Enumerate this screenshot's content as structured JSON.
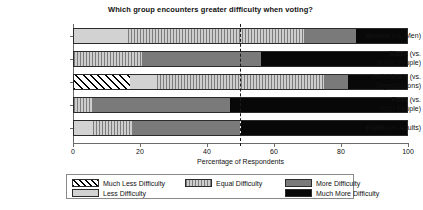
{
  "chart_data": {
    "type": "bar",
    "orientation": "horizontal",
    "stacked": true,
    "normalized": true,
    "title": "Which group encounters greater difficulty when voting?",
    "xlabel": "Percentage of Respondents",
    "ylabel": "",
    "xlim": [
      0,
      100
    ],
    "xticks": [
      0,
      20,
      40,
      60,
      80,
      100
    ],
    "xticklabels": [
      "0",
      "20",
      "40",
      "60",
      "80",
      "100"
    ],
    "grid": false,
    "legend_position": "bottom",
    "reference_line": {
      "value": 50,
      "style": "dashed",
      "color": "#1a1a1a"
    },
    "categories": [
      "Women (vs. Men)",
      "Black (vs. White People)",
      "Individuals (vs. Organizations)",
      "Poor (vs. Rich People)",
      "Youth (vs. Adults)"
    ],
    "category_parts": [
      {
        "group": "Women",
        "comparison": "(vs. Men)",
        "lines": [
          "Women|(vs. Men)"
        ]
      },
      {
        "group": "Black",
        "comparison": "(vs. White People)",
        "lines": [
          "Black|(vs.",
          "White People)"
        ]
      },
      {
        "group": "Individuals",
        "comparison": "(vs. Organizations)",
        "lines": [
          "Individuals|(vs.",
          "Organizations)"
        ]
      },
      {
        "group": "Poor",
        "comparison": "(vs. Rich People)",
        "lines": [
          "Poor|(vs.",
          "Rich People)"
        ]
      },
      {
        "group": "Youth",
        "comparison": "(vs. Adults)",
        "lines": [
          "Youth|(vs. Adults)"
        ]
      }
    ],
    "series": [
      {
        "name": "Much Less Difficulty",
        "key": "much_less",
        "color": "#ffffff",
        "pattern": "diagonal-hatch",
        "values": [
          0,
          0,
          17,
          0,
          0
        ]
      },
      {
        "name": "Less Difficulty",
        "key": "less",
        "color": "#d2d2d2",
        "pattern": "solid-light",
        "values": [
          16.5,
          0,
          8,
          0,
          6
        ]
      },
      {
        "name": "Equal Difficulty",
        "key": "equal",
        "color": "#b6b6b6",
        "pattern": "vertical-lines",
        "values": [
          52.5,
          20.6,
          50,
          6,
          12
        ]
      },
      {
        "name": "More Difficulty",
        "key": "more",
        "color": "#7a7a7a",
        "pattern": "solid-dark-gray",
        "values": [
          15.5,
          35.4,
          7,
          41,
          32
        ]
      },
      {
        "name": "Much More Difficulty",
        "key": "much_more",
        "color": "#080808",
        "pattern": "solid-black",
        "values": [
          15.5,
          44,
          18,
          53,
          50
        ]
      }
    ]
  },
  "legend": {
    "entries": [
      {
        "label": "Much Less Difficulty",
        "key": "much_less"
      },
      {
        "label": "Less Difficulty",
        "key": "less"
      },
      {
        "label": "Equal Difficulty",
        "key": "equal"
      },
      {
        "label": "More Difficulty",
        "key": "more"
      },
      {
        "label": "Much More Difficulty",
        "key": "much_more"
      }
    ]
  }
}
